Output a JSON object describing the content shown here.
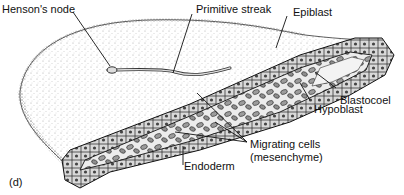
{
  "diagram": {
    "panel_letter": "(d)",
    "labels": {
      "hensons_node": "Henson's node",
      "primitive_streak": "Primitive streak",
      "epiblast": "Epiblast",
      "blastocoel": "Blastocoel",
      "hypoblast": "Hypoblast",
      "migrating_cells_line1": "Migrating cells",
      "migrating_cells_line2": "(mesenchyme)",
      "endoderm": "Endoderm"
    },
    "colors": {
      "ink": "#111111",
      "stipple": "#9a9a9a",
      "cell_fill": "#bdbdbd",
      "background": "#ffffff"
    }
  }
}
